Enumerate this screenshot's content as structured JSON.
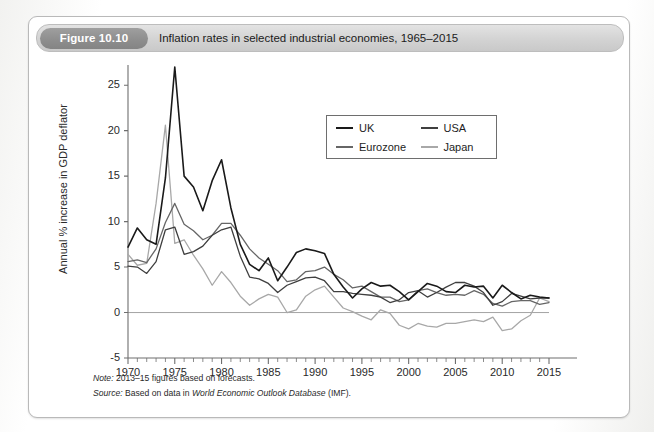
{
  "figure": {
    "badge": "Figure 10.10",
    "caption": "Inflation rates in selected industrial economies, 1965–2015"
  },
  "notes": {
    "note_key": "Note:",
    "note_text": " 2013–15 figures based on forecasts.",
    "source_key": "Source:",
    "source_pre": " Based on data in ",
    "source_italic": "World Economic Outlook Database",
    "source_post": " (IMF)."
  },
  "legend": {
    "position": "inside-top-right",
    "entries": [
      {
        "label": "UK",
        "color": "#1a1a1a"
      },
      {
        "label": "USA",
        "color": "#3f3f3f"
      },
      {
        "label": "Eurozone",
        "color": "#666666"
      },
      {
        "label": "Japan",
        "color": "#a8a8a8"
      }
    ]
  },
  "chart_data": {
    "type": "line",
    "title": "Inflation rates in selected industrial economies, 1965–2015",
    "xlabel": "",
    "ylabel": "Annual % increase in GDP deflator",
    "xlim": [
      1970,
      2015
    ],
    "ylim": [
      -5,
      27
    ],
    "grid": false,
    "zero_line": true,
    "y_ticks": [
      -5,
      0,
      5,
      10,
      15,
      20,
      25
    ],
    "x_ticks": [
      1970,
      1975,
      1980,
      1985,
      1990,
      1995,
      2000,
      2005,
      2010,
      2015
    ],
    "x_minor_tick_step": 1,
    "x": [
      1970,
      1971,
      1972,
      1973,
      1974,
      1975,
      1976,
      1977,
      1978,
      1979,
      1980,
      1981,
      1982,
      1983,
      1984,
      1985,
      1986,
      1987,
      1988,
      1989,
      1990,
      1991,
      1992,
      1993,
      1994,
      1995,
      1996,
      1997,
      1998,
      1999,
      2000,
      2001,
      2002,
      2003,
      2004,
      2005,
      2006,
      2007,
      2008,
      2009,
      2010,
      2011,
      2012,
      2013,
      2014,
      2015
    ],
    "series": [
      {
        "name": "UK",
        "color": "#1a1a1a",
        "values": [
          7.2,
          9.3,
          8.0,
          7.5,
          14.8,
          27.0,
          15.0,
          13.8,
          11.2,
          14.5,
          16.8,
          11.5,
          7.5,
          5.3,
          4.6,
          6.0,
          3.5,
          5.0,
          6.6,
          7.0,
          6.8,
          6.5,
          4.2,
          2.8,
          1.6,
          2.6,
          3.3,
          2.9,
          3.0,
          2.3,
          1.4,
          2.3,
          3.2,
          2.9,
          2.3,
          2.2,
          3.0,
          2.8,
          2.9,
          1.6,
          3.0,
          2.2,
          1.5,
          1.9,
          1.7,
          1.6
        ]
      },
      {
        "name": "USA",
        "color": "#3f3f3f",
        "values": [
          5.1,
          5.0,
          4.3,
          5.6,
          9.1,
          9.4,
          6.4,
          6.7,
          7.3,
          8.5,
          9.1,
          9.4,
          6.2,
          3.9,
          3.7,
          3.2,
          2.2,
          3.0,
          3.4,
          3.8,
          3.9,
          3.5,
          2.3,
          2.3,
          2.1,
          2.0,
          1.9,
          1.7,
          1.1,
          1.4,
          2.2,
          2.4,
          1.7,
          2.2,
          2.8,
          3.3,
          3.3,
          2.9,
          2.2,
          0.8,
          1.2,
          2.1,
          1.8,
          1.5,
          1.6,
          1.6
        ]
      },
      {
        "name": "Eurozone",
        "color": "#666666",
        "values": [
          5.6,
          5.8,
          5.5,
          7.0,
          9.9,
          12.0,
          9.7,
          9.0,
          8.0,
          8.5,
          9.8,
          9.8,
          8.5,
          7.0,
          6.0,
          5.3,
          4.6,
          3.4,
          3.6,
          4.5,
          4.6,
          5.0,
          4.2,
          3.6,
          2.7,
          2.9,
          2.3,
          1.7,
          1.7,
          1.2,
          1.4,
          2.4,
          2.6,
          2.2,
          1.9,
          2.0,
          1.9,
          2.4,
          2.0,
          1.0,
          0.7,
          1.2,
          1.3,
          1.3,
          0.9,
          1.1
        ]
      },
      {
        "name": "Japan",
        "color": "#a8a8a8",
        "values": [
          6.4,
          5.2,
          5.4,
          12.0,
          20.6,
          7.6,
          8.0,
          6.3,
          4.8,
          3.0,
          4.5,
          3.3,
          1.8,
          0.8,
          1.5,
          2.0,
          1.7,
          0.0,
          0.3,
          1.8,
          2.5,
          2.9,
          1.7,
          0.5,
          0.1,
          -0.4,
          -0.8,
          0.3,
          -0.1,
          -1.4,
          -1.8,
          -1.2,
          -1.5,
          -1.6,
          -1.2,
          -1.2,
          -1.0,
          -0.8,
          -1.0,
          -0.5,
          -2.0,
          -1.8,
          -0.9,
          -0.3,
          1.6,
          1.2
        ]
      }
    ],
    "annotations": []
  },
  "colors": {
    "card_border": "#b9b9b9",
    "title_bar": "#d3d3d3",
    "badge": "#8d8d8d",
    "axis": "#6e6e6e"
  }
}
